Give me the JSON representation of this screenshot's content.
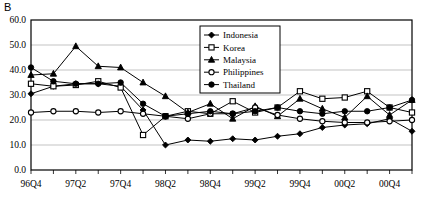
{
  "panel": {
    "label": "B"
  },
  "chart_data": {
    "type": "line",
    "title": "",
    "xlabel": "",
    "ylabel": "",
    "ylim": [
      0.0,
      60.0
    ],
    "ytick_step": 10.0,
    "ytick_labels": [
      "0.0",
      "10.0",
      "20.0",
      "30.0",
      "40.0",
      "50.0",
      "60.0"
    ],
    "yticks": [
      0.0,
      10.0,
      20.0,
      30.0,
      40.0,
      50.0,
      60.0
    ],
    "grid": "horizontal",
    "legend_position": "top-center-right",
    "x": [
      "96Q4",
      "97Q1",
      "97Q2",
      "97Q3",
      "97Q4",
      "98Q1",
      "98Q2",
      "98Q3",
      "98Q4",
      "99Q1",
      "99Q2",
      "99Q3",
      "99Q4",
      "00Q1",
      "00Q2",
      "00Q3",
      "00Q4",
      "01Q1"
    ],
    "xtick_labels": [
      "96Q4",
      "",
      "97Q2",
      "",
      "97Q4",
      "",
      "98Q2",
      "",
      "98Q4",
      "",
      "99Q2",
      "",
      "99Q4",
      "",
      "00Q2",
      "",
      "00Q4",
      ""
    ],
    "series": [
      {
        "name": "Indonesia",
        "marker": "filled-diamond",
        "color": "#000000",
        "values": [
          30.5,
          33.5,
          34.5,
          34.5,
          33.5,
          24.0,
          10.0,
          12.0,
          11.5,
          12.5,
          12.0,
          13.5,
          14.5,
          17.0,
          18.0,
          18.5,
          20.5,
          15.5
        ]
      },
      {
        "name": "Korea",
        "marker": "open-square",
        "color": "#000000",
        "values": [
          34.5,
          33.5,
          34.0,
          35.5,
          33.0,
          14.0,
          21.5,
          23.5,
          22.5,
          27.5,
          23.0,
          25.0,
          31.5,
          28.5,
          29.0,
          31.5,
          25.0,
          23.0
        ]
      },
      {
        "name": "Malaysia",
        "marker": "filled-triangle",
        "color": "#000000",
        "values": [
          38.0,
          38.5,
          49.5,
          41.5,
          41.0,
          35.0,
          29.5,
          23.0,
          26.5,
          20.5,
          25.5,
          21.5,
          28.5,
          24.5,
          21.0,
          29.5,
          22.0,
          28.0
        ]
      },
      {
        "name": "Philippines",
        "marker": "open-circle",
        "color": "#000000",
        "values": [
          23.0,
          23.5,
          23.5,
          23.0,
          23.5,
          22.5,
          21.5,
          20.5,
          22.5,
          22.5,
          25.0,
          22.0,
          20.5,
          19.5,
          19.0,
          19.0,
          19.5,
          20.0
        ]
      },
      {
        "name": "Thailand",
        "marker": "filled-circle",
        "color": "#000000",
        "values": [
          41.0,
          35.5,
          34.5,
          34.5,
          35.0,
          26.5,
          21.5,
          22.5,
          23.5,
          22.5,
          23.5,
          25.0,
          23.5,
          22.5,
          23.5,
          23.5,
          25.0,
          28.0
        ]
      }
    ]
  }
}
